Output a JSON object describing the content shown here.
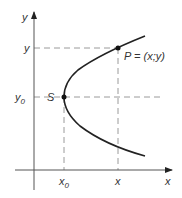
{
  "diagram": {
    "type": "parabola-graph",
    "axes": {
      "x_label": "x",
      "y_label": "y"
    },
    "points": {
      "vertex": {
        "label": "S",
        "x_label": "x",
        "x_sub": "0",
        "y_label": "y",
        "y_sub": "0"
      },
      "point": {
        "label": "P = (x;y)",
        "x_label": "x",
        "y_label": "y"
      }
    },
    "colors": {
      "axis": "#333333",
      "curve": "#222222",
      "dashed": "#999999",
      "text": "#333333"
    }
  }
}
